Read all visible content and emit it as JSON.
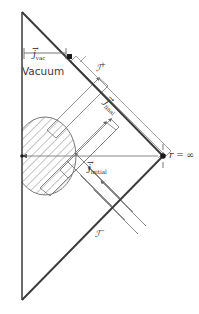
{
  "figure": {
    "type": "penrose-conformal-diagram",
    "background": "#ffffff",
    "line_color": "#3a3a3a",
    "text_color": "#2b2b2b",
    "width": 199,
    "height": 314
  },
  "labels": {
    "vacuum": "Vacuum",
    "scri_plus_symbol": "ℐ",
    "scri_plus_sign": "+",
    "scri_minus_symbol": "ℐ",
    "scri_minus_sign": "−",
    "r_zero": "r",
    "r_zero_eq": " = 0",
    "r_infinity": "r",
    "r_infinity_eq": " = ∞",
    "j_vac_symbol": "j",
    "j_vac_sub": "vac",
    "j_initial_symbol": "j",
    "j_initial_sub": "initial",
    "j_final_symbol": "j",
    "j_final_sub": "final",
    "vector_arrow": "→"
  },
  "regions": {
    "collapsing_body": {
      "name": "hatched-disk",
      "hatch_angle_deg": 45,
      "center_x": 45,
      "center_y": 156,
      "radius_x": 31,
      "radius_y": 39
    },
    "vacuum_region": {
      "name": "vacuum-wedge"
    }
  },
  "geometry": {
    "top_vertex": [
      22,
      12
    ],
    "bottom_vertex": [
      22,
      300
    ],
    "right_vertex": [
      163,
      156
    ],
    "left_axis_x": 22,
    "marker_on_scri_plus": [
      70,
      57
    ],
    "marker_at_infinity": [
      163,
      156
    ]
  },
  "flows": {
    "outgoing": {
      "name": "outgoing-null-rays",
      "direction": "up-right",
      "count": 3
    },
    "incoming": {
      "name": "incoming-null-rays",
      "direction": "up-left",
      "count": 3
    },
    "initial": {
      "name": "initial-current-arrow",
      "direction": "left"
    }
  }
}
